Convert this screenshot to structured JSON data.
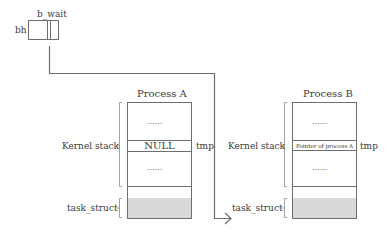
{
  "bh_box": {
    "label_left": "bh",
    "label_top": "b_wait"
  },
  "process_a": {
    "title": "Process A",
    "kernel_stack_label": "Kernel stack",
    "task_struct_label": "task_struct",
    "dots_top": "......",
    "slot_value": "NULL",
    "dots_bottom": "......",
    "tmp_label": "tmp"
  },
  "process_b": {
    "title": "Process B",
    "kernel_stack_label": "Kernel stack",
    "task_struct_label": "task_struct",
    "dots_top": "......",
    "slot_value": "Pointer of process A",
    "dots_bottom": "......",
    "tmp_label": "tmp"
  },
  "colors": {
    "line": "#6e6e6e",
    "shade": "#d9d9d9",
    "text": "#3a3a3a"
  }
}
